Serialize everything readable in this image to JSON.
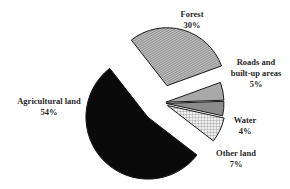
{
  "chart_data": {
    "type": "pie",
    "title": "",
    "exploded": true,
    "slices": [
      {
        "label": "Forest",
        "value": 30,
        "value_label": "30%",
        "fill": "hatch-diagonal",
        "color": "#9a9a9a"
      },
      {
        "label": "Roads and built-up areas",
        "value": 5,
        "value_label": "5%",
        "fill": "solid",
        "color": "#a8a8a8"
      },
      {
        "label": "Water",
        "value": 4,
        "value_label": "4%",
        "fill": "solid",
        "color": "#8c8c8c"
      },
      {
        "label": "Other land",
        "value": 7,
        "value_label": "7%",
        "fill": "crosshatch",
        "color": "#d8d8d8"
      },
      {
        "label": "Agricultural land",
        "value": 54,
        "value_label": "54%",
        "fill": "solid",
        "color": "#0a0a0a"
      }
    ],
    "legend": "none (direct labels)"
  },
  "labels": {
    "forest": {
      "name": "Forest",
      "pct": "30%"
    },
    "roads": {
      "line1": "Roads and",
      "line2": "built-up areas",
      "pct": "5%"
    },
    "water": {
      "name": "Water",
      "pct": "4%"
    },
    "other": {
      "name": "Other land",
      "pct": "7%"
    },
    "agri": {
      "name": "Agricultural land",
      "pct": "54%"
    }
  }
}
